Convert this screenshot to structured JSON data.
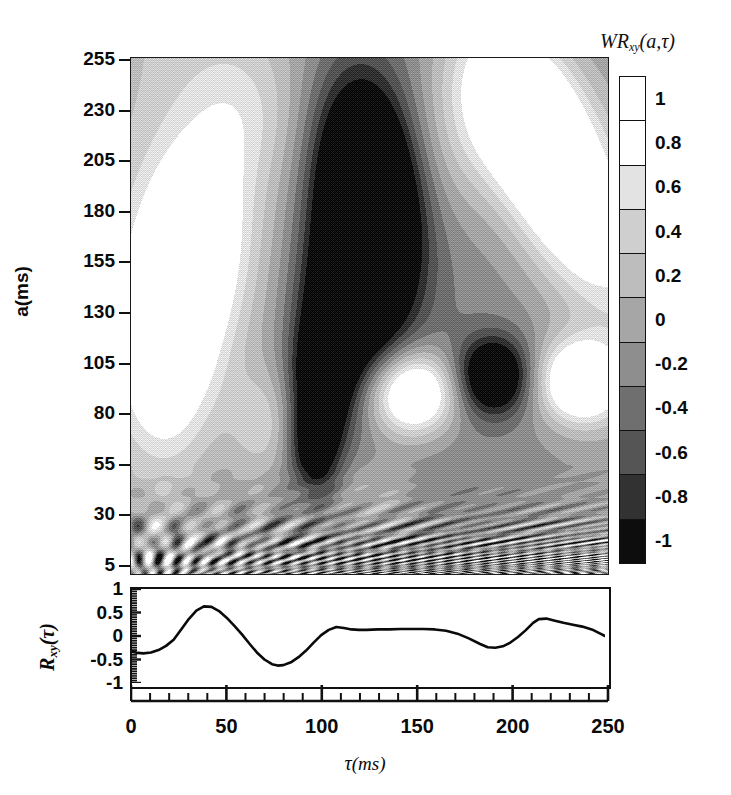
{
  "figure": {
    "kind": "wavelet-cross-correlation-map",
    "colors": {
      "ink": "#0a0a0a",
      "frame": "#111111",
      "background": "#ffffff"
    }
  },
  "colorbar": {
    "title_main": "WR",
    "title_sub": "xy",
    "title_args": "(a,τ)",
    "vmin": -1,
    "vmax": 1,
    "step": 0.2,
    "labels": [
      "1",
      "0.8",
      "0.6",
      "0.4",
      "0.2",
      "0",
      "-0.2",
      "-0.4",
      "-0.6",
      "-0.8",
      "-1"
    ],
    "band_grays": [
      "#ffffff",
      "#ffffff",
      "#e3e3e3",
      "#cfcfcf",
      "#bdbdbd",
      "#a6a6a6",
      "#8e8e8e",
      "#6f6f6f",
      "#555555",
      "#323232",
      "#0d0d0d"
    ]
  },
  "contour_axes": {
    "ylabel": "a(ms)",
    "yticks": [
      255,
      230,
      205,
      180,
      155,
      130,
      105,
      80,
      55,
      30,
      5
    ],
    "ytick_labels": [
      "255",
      "230",
      "205",
      "180",
      "155",
      "130",
      "105",
      "80",
      "55",
      "30",
      "5"
    ],
    "ylim": [
      1,
      256
    ],
    "xlim": [
      0,
      250
    ]
  },
  "lower_axes": {
    "ylabel_main": "R",
    "ylabel_sub": "xy",
    "ylabel_args": "(τ)",
    "yticks": [
      1,
      0.5,
      0,
      -0.5,
      -1
    ],
    "ytick_labels": [
      "1",
      "0.5",
      "0",
      "-0.5",
      "-1"
    ],
    "ylim": [
      -1,
      1
    ],
    "xlim": [
      0,
      250
    ]
  },
  "xaxis": {
    "label_main": "τ",
    "label_unit": "(ms)",
    "ticks": [
      0,
      50,
      100,
      150,
      200,
      250
    ],
    "tick_labels": [
      "0",
      "50",
      "100",
      "150",
      "200",
      "250"
    ],
    "minor_step": 10
  },
  "chart_data": [
    {
      "type": "heatmap",
      "title": "Wavelet cross-correlation coefficient map",
      "xlabel": "τ(ms)",
      "ylabel": "a(ms)",
      "xlim": [
        0,
        250
      ],
      "ylim": [
        1,
        256
      ],
      "zlim": [
        -1,
        1
      ],
      "colormap": "grayscale-discrete-11",
      "grid": false,
      "features": [
        {
          "name": "bright-lobe-left",
          "tau": 28,
          "a": 150,
          "value": 1.0,
          "extent_tau": [
            8,
            55
          ],
          "extent_a": [
            95,
            215
          ]
        },
        {
          "name": "dark-core-center",
          "tau": 122,
          "a": 185,
          "value": -1.0,
          "extent_tau": [
            100,
            150
          ],
          "extent_a": [
            120,
            235
          ]
        },
        {
          "name": "dark-column-mid",
          "tau": 100,
          "a": 95,
          "value": -0.7,
          "extent_tau": [
            85,
            118
          ],
          "extent_a": [
            60,
            125
          ]
        },
        {
          "name": "bright-blob-mid",
          "tau": 148,
          "a": 90,
          "value": 1.0,
          "extent_tau": [
            128,
            168
          ],
          "extent_a": [
            70,
            110
          ]
        },
        {
          "name": "dark-blob-right",
          "tau": 190,
          "a": 98,
          "value": -0.7,
          "extent_tau": [
            172,
            208
          ],
          "extent_a": [
            80,
            120
          ]
        },
        {
          "name": "bright-blob-far-right",
          "tau": 232,
          "a": 95,
          "value": 1.0,
          "extent_tau": [
            215,
            250
          ],
          "extent_a": [
            78,
            115
          ]
        },
        {
          "name": "bright-diagonal-band-right",
          "tau": 222,
          "a": 195,
          "value": 1.0,
          "extent_tau": [
            195,
            250
          ],
          "extent_a": [
            120,
            240
          ]
        },
        {
          "name": "cone-of-influence-ripples",
          "tau": 125,
          "a": 18,
          "value": 0.0,
          "extent_tau": [
            0,
            250
          ],
          "extent_a": [
            1,
            40
          ]
        }
      ]
    },
    {
      "type": "line",
      "title": "Cross-correlation function",
      "xlabel": "τ(ms)",
      "ylabel": "R_xy(τ)",
      "xlim": [
        0,
        250
      ],
      "ylim": [
        -1,
        1
      ],
      "grid": false,
      "series": [
        {
          "name": "R_xy",
          "x": [
            0,
            3,
            6,
            10,
            14,
            18,
            22,
            26,
            30,
            34,
            38,
            42,
            46,
            50,
            54,
            58,
            62,
            66,
            70,
            74,
            77,
            80,
            84,
            88,
            92,
            96,
            100,
            104,
            108,
            112,
            116,
            120,
            124,
            130,
            136,
            142,
            148,
            154,
            160,
            166,
            172,
            178,
            184,
            188,
            192,
            196,
            200,
            204,
            208,
            212,
            215,
            219,
            223,
            228,
            233,
            238,
            243,
            247,
            250
          ],
          "y": [
            -0.33,
            -0.36,
            -0.37,
            -0.35,
            -0.3,
            -0.21,
            -0.08,
            0.14,
            0.36,
            0.54,
            0.63,
            0.62,
            0.53,
            0.39,
            0.22,
            0.04,
            -0.16,
            -0.35,
            -0.5,
            -0.6,
            -0.63,
            -0.62,
            -0.56,
            -0.45,
            -0.31,
            -0.14,
            0.02,
            0.13,
            0.19,
            0.17,
            0.14,
            0.13,
            0.13,
            0.14,
            0.14,
            0.15,
            0.15,
            0.15,
            0.14,
            0.11,
            0.05,
            -0.05,
            -0.17,
            -0.24,
            -0.25,
            -0.22,
            -0.14,
            -0.02,
            0.12,
            0.28,
            0.36,
            0.37,
            0.33,
            0.28,
            0.24,
            0.2,
            0.14,
            0.06,
            0.0
          ]
        }
      ]
    }
  ]
}
